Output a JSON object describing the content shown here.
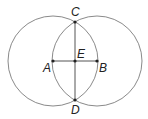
{
  "diagram": {
    "type": "geometric-construction",
    "colors": {
      "circle": "#8a8a8a",
      "segment": "#555555",
      "point": "#222222",
      "label": "#222222"
    },
    "circles": [
      {
        "name": "circle-centered-at-A",
        "center": "A",
        "cx": 53,
        "cy": 61,
        "r": 45
      },
      {
        "name": "circle-centered-at-B",
        "center": "B",
        "cx": 97,
        "cy": 61,
        "r": 45
      }
    ],
    "points": {
      "A": {
        "label": "A",
        "x": 53,
        "y": 61
      },
      "B": {
        "label": "B",
        "x": 97,
        "y": 61
      },
      "C": {
        "label": "C",
        "x": 75,
        "y": 22
      },
      "D": {
        "label": "D",
        "x": 75,
        "y": 100
      },
      "E": {
        "label": "E",
        "x": 75,
        "y": 61
      }
    },
    "segments": [
      {
        "name": "segment-AB",
        "from": "A",
        "to": "B"
      },
      {
        "name": "segment-CD",
        "from": "C",
        "to": "D"
      }
    ]
  }
}
